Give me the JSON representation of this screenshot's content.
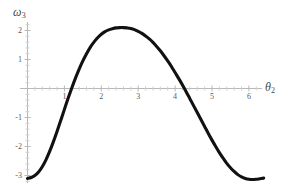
{
  "chart_data": {
    "type": "line",
    "title": "",
    "xlabel": "θ₂",
    "ylabel": "ω₃",
    "xlabel_base": "θ",
    "xlabel_sub": "2",
    "ylabel_base": "ω",
    "ylabel_sub": "3",
    "xlim": [
      0,
      6.45
    ],
    "ylim": [
      -3.35,
      2.35
    ],
    "grid": false,
    "legend": null,
    "xticks": [
      1,
      2,
      3,
      4,
      5,
      6
    ],
    "xtick_labels": [
      "1",
      "2",
      "3",
      "4",
      "5",
      "6"
    ],
    "yticks": [
      2,
      1,
      -1,
      -2,
      -3
    ],
    "ytick_labels": [
      "2",
      "1",
      "-1",
      "-2",
      "-3"
    ],
    "axis_color": "#b8b8b8",
    "curve_color": "#111111",
    "curve_width": 3.1,
    "background": "#ffffff",
    "series": [
      {
        "name": "ω₃(θ₂)",
        "x": [
          0.0,
          0.1,
          0.2,
          0.3,
          0.4,
          0.5,
          0.6,
          0.7,
          0.8,
          0.9,
          1.0,
          1.1,
          1.2,
          1.3,
          1.4,
          1.5,
          1.6,
          1.7,
          1.8,
          1.9,
          2.0,
          2.1,
          2.2,
          2.3,
          2.4,
          2.5,
          2.6,
          2.7,
          2.8,
          2.9,
          3.0,
          3.1,
          3.2,
          3.3,
          3.4,
          3.5,
          3.6,
          3.7,
          3.8,
          3.9,
          4.0,
          4.1,
          4.2,
          4.3,
          4.4,
          4.5,
          4.6,
          4.7,
          4.8,
          4.9,
          5.0,
          5.1,
          5.2,
          5.3,
          5.4,
          5.5,
          5.6,
          5.7,
          5.8,
          5.9,
          6.0,
          6.1,
          6.2,
          6.3,
          6.4
        ],
        "y": [
          -3.1,
          -3.07,
          -3.0,
          -2.88,
          -2.7,
          -2.46,
          -2.17,
          -1.84,
          -1.48,
          -1.1,
          -0.72,
          -0.34,
          0.02,
          0.36,
          0.67,
          0.95,
          1.2,
          1.42,
          1.6,
          1.75,
          1.87,
          1.96,
          2.02,
          2.06,
          2.09,
          2.1,
          2.1,
          2.09,
          2.07,
          2.03,
          1.97,
          1.9,
          1.81,
          1.71,
          1.59,
          1.45,
          1.3,
          1.13,
          0.95,
          0.76,
          0.55,
          0.34,
          0.12,
          -0.11,
          -0.35,
          -0.59,
          -0.83,
          -1.07,
          -1.31,
          -1.55,
          -1.78,
          -2.0,
          -2.21,
          -2.4,
          -2.58,
          -2.73,
          -2.86,
          -2.97,
          -3.05,
          -3.1,
          -3.13,
          -3.14,
          -3.13,
          -3.11,
          -3.09
        ]
      }
    ],
    "annotations": {
      "zero_crossings": [
        1.19,
        4.25
      ],
      "maximum": {
        "x": 2.55,
        "y": 2.1
      },
      "endpoints": [
        {
          "x": 0.0,
          "y": -3.1
        },
        {
          "x": 6.4,
          "y": -3.09
        }
      ]
    }
  }
}
